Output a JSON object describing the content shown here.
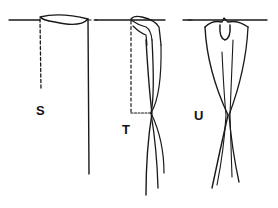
{
  "diagram": {
    "stroke_color": "#1a1a1a",
    "background": "#ffffff",
    "figures": [
      {
        "id": "S",
        "label": "S"
      },
      {
        "id": "T",
        "label": "T"
      },
      {
        "id": "U",
        "label": "U"
      }
    ]
  }
}
